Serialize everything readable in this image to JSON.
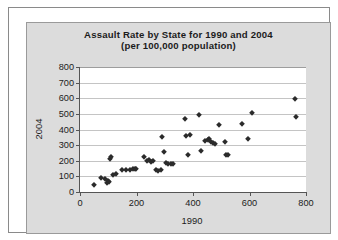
{
  "figure": {
    "title_line_1": "Assault Rate by State for 1990 and 2004",
    "title_line_2": "(per 100,000 population)",
    "marker_color": "#2b2b2b",
    "panel_color": "#dcdcdc",
    "plot_background": "#ffffff",
    "gridline_color": "#c4c4c4",
    "axis_color": "#555555"
  },
  "chart_data": {
    "type": "scatter",
    "title": "Assault Rate by State for 1990 and 2004 (per 100,000 population)",
    "subtitle": "(per 100,000 population)",
    "xlabel": "1990",
    "ylabel": "2004",
    "xlim": [
      0,
      800
    ],
    "ylim": [
      0,
      800
    ],
    "xticks": [
      0,
      200,
      400,
      600,
      800
    ],
    "yticks": [
      0,
      100,
      200,
      300,
      400,
      500,
      600,
      700,
      800
    ],
    "grid": "horizontal",
    "legend": "none",
    "series": [
      {
        "name": "States",
        "points": [
          [
            50,
            47
          ],
          [
            75,
            92
          ],
          [
            88,
            85
          ],
          [
            95,
            60
          ],
          [
            99,
            72
          ],
          [
            102,
            63
          ],
          [
            106,
            212
          ],
          [
            108,
            226
          ],
          [
            118,
            110
          ],
          [
            126,
            113
          ],
          [
            150,
            143
          ],
          [
            163,
            140
          ],
          [
            178,
            143
          ],
          [
            186,
            148
          ],
          [
            193,
            150
          ],
          [
            199,
            147
          ],
          [
            225,
            222
          ],
          [
            238,
            196
          ],
          [
            244,
            203
          ],
          [
            250,
            190
          ],
          [
            258,
            196
          ],
          [
            268,
            143
          ],
          [
            276,
            137
          ],
          [
            285,
            140
          ],
          [
            292,
            352
          ],
          [
            296,
            258
          ],
          [
            305,
            183
          ],
          [
            313,
            180
          ],
          [
            322,
            182
          ],
          [
            330,
            178
          ],
          [
            370,
            470
          ],
          [
            374,
            357
          ],
          [
            381,
            237
          ],
          [
            389,
            368
          ],
          [
            422,
            495
          ],
          [
            428,
            261
          ],
          [
            441,
            325
          ],
          [
            452,
            330
          ],
          [
            458,
            337
          ],
          [
            463,
            322
          ],
          [
            470,
            311
          ],
          [
            479,
            305
          ],
          [
            492,
            428
          ],
          [
            512,
            318
          ],
          [
            518,
            240
          ],
          [
            524,
            237
          ],
          [
            572,
            435
          ],
          [
            596,
            338
          ],
          [
            608,
            503
          ],
          [
            760,
            597
          ],
          [
            766,
            480
          ]
        ]
      }
    ]
  },
  "axes": {
    "y_tick_labels": [
      "800",
      "700",
      "600",
      "500",
      "400",
      "300",
      "200",
      "100",
      "0"
    ],
    "x_tick_labels": [
      "0",
      "200",
      "400",
      "600",
      "800"
    ]
  }
}
